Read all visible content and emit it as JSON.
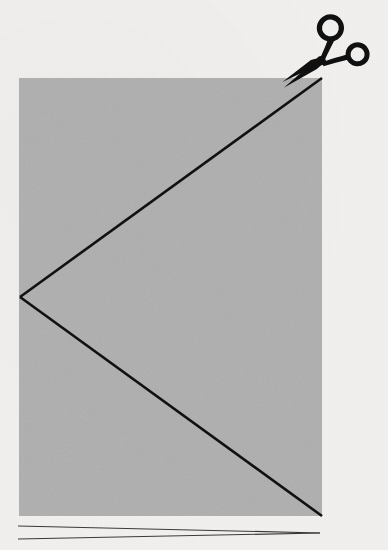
{
  "figure": {
    "title": "Folded paper with cut line and scissors",
    "background_color": "#f1f0ee",
    "ink_color": "#111111",
    "paper": {
      "name": "folded-paper-sheet",
      "fill_color": "#aeaeae",
      "x": 19,
      "y": 78,
      "width": 303,
      "height": 438
    },
    "fold_vertex": {
      "x": 20,
      "y": 297
    },
    "cut_line_upper": {
      "label": "cut-line-upper",
      "x1": 20,
      "y1": 297,
      "x2": 322,
      "y2": 78,
      "stroke_width": 2.6
    },
    "cut_line_lower": {
      "label": "cut-line-lower",
      "x1": 20,
      "y1": 297,
      "x2": 322,
      "y2": 516,
      "stroke_width": 2.6
    },
    "scissors": {
      "name": "scissors",
      "color": "#101010",
      "pivot_x": 316,
      "pivot_y": 64,
      "blade_tip_x": 286,
      "blade_tip_y": 84,
      "ring_large": {
        "cx": 338,
        "cy": 41,
        "r": 11
      },
      "ring_small": {
        "cx": 362,
        "cy": 59,
        "r": 9.5
      }
    },
    "baseline_rules": [
      {
        "label": "baseline-rule-top",
        "x1": 18,
        "y1": 526,
        "x2": 320,
        "y2": 533,
        "stroke_width": 1.2
      },
      {
        "label": "baseline-rule-bottom",
        "x1": 18,
        "y1": 539,
        "x2": 320,
        "y2": 533,
        "stroke_width": 1.2
      }
    ]
  },
  "chart_data": {
    "type": "diagram",
    "title": "Folded paper with cut line and scissors",
    "elements": [
      {
        "kind": "rectangle",
        "name": "paper",
        "x": 19,
        "y": 78,
        "width": 303,
        "height": 438,
        "fill": "#aeaeae"
      },
      {
        "kind": "line",
        "name": "cut-line-upper",
        "from": [
          20,
          297
        ],
        "to": [
          322,
          78
        ],
        "stroke": "#111111"
      },
      {
        "kind": "line",
        "name": "cut-line-lower",
        "from": [
          20,
          297
        ],
        "to": [
          322,
          516
        ],
        "stroke": "#111111"
      },
      {
        "kind": "icon",
        "name": "scissors",
        "at": [
          330,
          55
        ],
        "fill": "#101010"
      },
      {
        "kind": "line",
        "name": "baseline-rule-top",
        "from": [
          18,
          526
        ],
        "to": [
          320,
          533
        ],
        "stroke": "#333333"
      },
      {
        "kind": "line",
        "name": "baseline-rule-bottom",
        "from": [
          18,
          539
        ],
        "to": [
          320,
          533
        ],
        "stroke": "#333333"
      }
    ]
  }
}
